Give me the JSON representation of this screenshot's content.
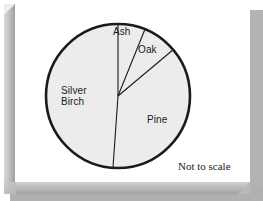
{
  "figure": {
    "note": "Not to scale",
    "frame_color": "#b3b3b3",
    "background_color": "#ffffff"
  },
  "chart_data": {
    "type": "pie",
    "title": "",
    "subtitle": "",
    "xlabel": "",
    "ylabel": "",
    "legend_position": "none",
    "grid": false,
    "not_to_scale": true,
    "center": {
      "x": 118,
      "y": 96
    },
    "radius": 72,
    "start_angle_deg": -90,
    "direction": "clockwise",
    "slice_fill": "#ececec",
    "slice_stroke": "#1a1a1a",
    "outline_width": 2.6,
    "divider_width": 1.1,
    "categories": [
      "Ash",
      "Oak",
      "Pine",
      "Silver Birch"
    ],
    "values": [
      22,
      28,
      134,
      176
    ],
    "value_units": "degrees",
    "slices": [
      {
        "label": "Ash",
        "angle_deg": 22,
        "start_deg": -90,
        "end_deg": -68,
        "label_x": 113,
        "label_y": 26,
        "fill": "#ececec"
      },
      {
        "label": "Oak",
        "angle_deg": 28,
        "start_deg": -68,
        "end_deg": -40,
        "label_x": 138,
        "label_y": 44,
        "fill": "#ececec"
      },
      {
        "label": "Pine",
        "angle_deg": 134,
        "start_deg": -40,
        "end_deg": 94,
        "label_x": 147,
        "label_y": 114,
        "fill": "#ececec"
      },
      {
        "label": "Silver\nBirch",
        "label_line1": "Silver",
        "label_line2": "Birch",
        "angle_deg": 176,
        "start_deg": 94,
        "end_deg": 270,
        "label_x": 61,
        "label_y": 85,
        "fill": "#ececec"
      }
    ]
  }
}
